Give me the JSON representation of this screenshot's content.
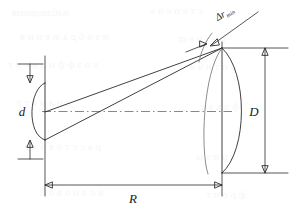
{
  "figure": {
    "background_color": "#ffffff",
    "line_color": "#2b2b2b",
    "axis_color": "#7a7a7a",
    "width": 296,
    "height": 212
  },
  "labels": {
    "small_aperture": "d",
    "large_aperture": "D",
    "separation": "R",
    "delta_r": "Δr",
    "delta_r_subscript": "min"
  },
  "elements": {
    "small_lens_name": "small plano-convex lens",
    "large_lens_name": "large plano-convex lens",
    "wavefront_name": "wavefront arc",
    "optical_axis_name": "optical axis",
    "upper_ray_name": "upper converging ray",
    "lower_ray_name": "lower converging ray"
  },
  "dimensions": {
    "d_arrow": "vertical double-headed arrow spanning small lens aperture",
    "D_arrow": "vertical double-headed arrow spanning large lens aperture",
    "R_arrow": "horizontal double-headed arrow spanning lens separation",
    "delta_r_arrow": "diagonal leader arrow to wavefront gap"
  }
}
